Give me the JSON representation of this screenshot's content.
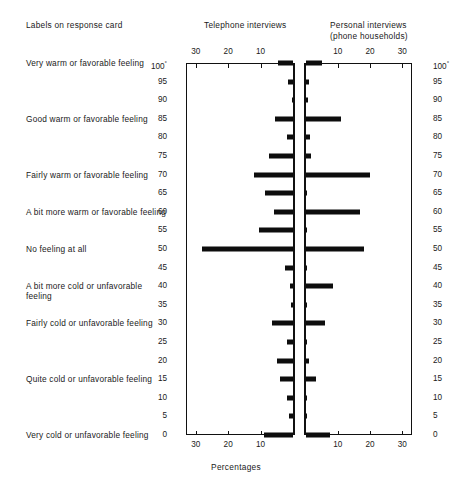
{
  "header": {
    "labels_col": "Labels on response card",
    "telephone": "Telephone interviews",
    "personal_line1": "Personal interviews",
    "personal_line2": "(phone households)"
  },
  "axis_caption": "Percentages",
  "row_labels": [
    {
      "value": 100,
      "text": "Very warm or favorable feeling"
    },
    {
      "value": 85,
      "text": "Good warm or favorable feeling"
    },
    {
      "value": 70,
      "text": "Fairly warm or favorable feeling"
    },
    {
      "value": 60,
      "text": "A bit more warm or favorable feeling"
    },
    {
      "value": 50,
      "text": "No feeling at all"
    },
    {
      "value": 40,
      "text": "A bit more cold or unfavorable feeling"
    },
    {
      "value": 30,
      "text": "Fairly cold or unfavorable feeling"
    },
    {
      "value": 15,
      "text": "Quite cold or unfavorable feeling"
    },
    {
      "value": 0,
      "text": "Very cold or unfavorable feeling"
    }
  ],
  "y_ticks": [
    "100",
    "95",
    "90",
    "85",
    "80",
    "75",
    "70",
    "65",
    "60",
    "55",
    "50",
    "45",
    "40",
    "35",
    "30",
    "25",
    "20",
    "15",
    "10",
    "5",
    "0"
  ],
  "y_top_label_suffix": "°",
  "x_ticks_telephone": [
    "30",
    "20",
    "10"
  ],
  "x_ticks_personal": [
    "10",
    "20",
    "30"
  ],
  "chart_data": {
    "type": "bar",
    "title": "",
    "subtitle": "",
    "orientation": "horizontal-back-to-back",
    "xlabel": "Percentages",
    "ylabel": "",
    "ylim": [
      0,
      100
    ],
    "y_tick_step": 5,
    "xlim_left": [
      30,
      0
    ],
    "xlim_right": [
      0,
      30
    ],
    "grid": false,
    "legend_position": "column-headers",
    "categories": [
      100,
      95,
      90,
      85,
      80,
      75,
      70,
      65,
      60,
      55,
      50,
      45,
      40,
      35,
      30,
      25,
      20,
      15,
      10,
      5,
      0
    ],
    "series": [
      {
        "name": "Telephone interviews",
        "side": "left",
        "values": [
          4.5,
          1.5,
          0.4,
          5.5,
          2.0,
          7.5,
          12.0,
          8.5,
          6.0,
          10.5,
          28.0,
          2.5,
          1.0,
          0.5,
          6.5,
          1.8,
          5.0,
          4.0,
          2.0,
          1.2,
          9.0
        ]
      },
      {
        "name": "Personal interviews (phone households)",
        "side": "right",
        "values": [
          5.0,
          1.2,
          0.9,
          11.0,
          1.5,
          1.6,
          20.0,
          0.3,
          17.0,
          0.4,
          18.0,
          0.3,
          8.5,
          0.4,
          6.0,
          0.3,
          1.2,
          3.2,
          0.3,
          0.3,
          7.5
        ]
      }
    ]
  }
}
